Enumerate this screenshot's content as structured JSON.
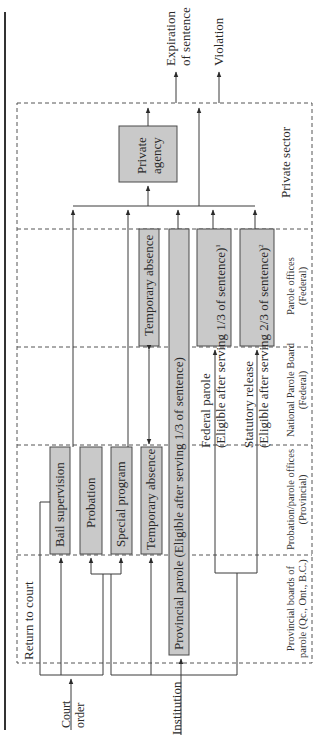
{
  "diagram": {
    "colors": {
      "box_fill": "#c9c9c9",
      "box_stroke": "#4a4a4a",
      "line": "#3a3a3a",
      "dash": "#555555"
    },
    "inputs": {
      "court_order": "Court\norder",
      "court_order_l1": "Court",
      "court_order_l2": "order",
      "institution": "Institution"
    },
    "outputs": {
      "expiration_l1": "Expiration",
      "expiration_l2": "of sentence",
      "violation": "Violation"
    },
    "return_to_court": "Return to court",
    "columns": {
      "provincial_boards_l1": "Provincial boards of",
      "provincial_boards_l2": "parole (Qc., Ont., B.C.)",
      "probation_offices_l1": "Probation/parole offices",
      "probation_offices_l2": "(Provincial)",
      "npb_l1": "National Parole Board",
      "npb_l2": "(Federal)",
      "parole_offices_l1": "Parole offices",
      "parole_offices_l2": "(Federal)",
      "private_sector": "Private sector"
    },
    "boxes": {
      "bail_supervision": "Bail supervision",
      "probation": "Probation",
      "special_program": "Special program",
      "temporary_absence_prov": "Temporary absence",
      "temporary_absence_fed": "Temporary absence",
      "provincial_parole": "Provincial parole (Eligible after serving 1/3 of sentence)",
      "federal_parole_l1": "Federal parole",
      "federal_parole_l2": "(Eligible after serving 1/3 of sentence)",
      "federal_parole_note": "1",
      "statutory_release_l1": "Statutory release",
      "statutory_release_l2": "(Eligible after serving 2/3 of sentence)",
      "statutory_release_note": "2",
      "private_agency_l1": "Private",
      "private_agency_l2": "agency"
    }
  }
}
